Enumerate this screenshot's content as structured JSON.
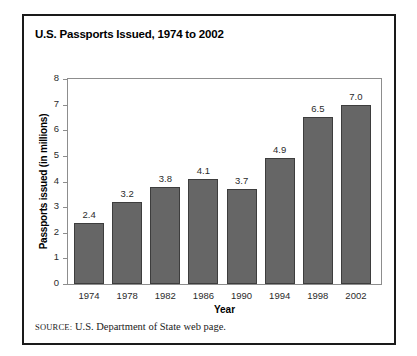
{
  "figure": {
    "title": "U.S. Passports Issued, 1974 to 2002",
    "source_label": "Source:",
    "source_text": "U.S. Department of State web page.",
    "frame_color": "#1a1a1a",
    "background_color": "#ffffff"
  },
  "chart_data": {
    "type": "bar",
    "title": "U.S. Passports Issued, 1974 to 2002",
    "xlabel": "Year",
    "ylabel": "Passports issued (in millions)",
    "categories": [
      "1974",
      "1978",
      "1982",
      "1986",
      "1990",
      "1994",
      "1998",
      "2002"
    ],
    "values": [
      2.4,
      3.2,
      3.8,
      4.1,
      3.7,
      4.9,
      6.5,
      7.0
    ],
    "value_labels": [
      "2.4",
      "3.2",
      "3.8",
      "4.1",
      "3.7",
      "4.9",
      "6.5",
      "7.0"
    ],
    "ylim": [
      0,
      8
    ],
    "yticks": [
      0,
      1,
      2,
      3,
      4,
      5,
      6,
      7,
      8
    ],
    "ytick_labels": [
      "0",
      "1",
      "2",
      "3",
      "4",
      "5",
      "6",
      "7",
      "8"
    ],
    "grid": false,
    "legend": false,
    "bar_fill_color": "#666666",
    "bar_border_color": "#3d3d3d",
    "axis_color": "#8d8d8d"
  }
}
